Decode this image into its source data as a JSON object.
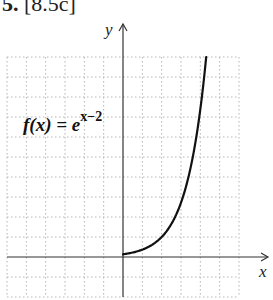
{
  "header": {
    "number": "5.",
    "reference": "[8.5c]"
  },
  "chart_data": {
    "type": "line",
    "title": "",
    "function_label": {
      "lhs": "f(x) = e",
      "exponent": "x−2"
    },
    "function": "f(x) = e^(x-2)",
    "xlabel": "x",
    "ylabel": "y",
    "xlim": [
      -6,
      6
    ],
    "ylim": [
      -2,
      10
    ],
    "grid": true,
    "grid_style": "dotted",
    "x": [
      0,
      0.5,
      1,
      1.5,
      2,
      2.5,
      3,
      3.5,
      4,
      4.3
    ],
    "values": [
      0.135,
      0.223,
      0.368,
      0.607,
      1.0,
      1.649,
      2.718,
      4.482,
      7.389,
      9.974
    ],
    "colors": {
      "curve": "#111111",
      "axes": "#333333",
      "grid": "#b5b5b5"
    }
  }
}
